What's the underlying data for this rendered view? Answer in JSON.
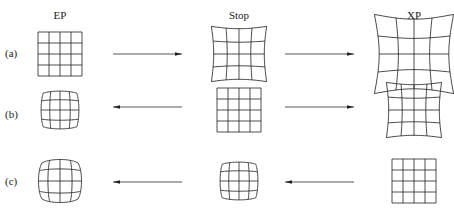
{
  "columns": [
    {
      "id": "ep",
      "label": "EP"
    },
    {
      "id": "stop",
      "label": "Stop"
    },
    {
      "id": "xp",
      "label": "XP"
    }
  ],
  "rows": [
    {
      "label": "(a)",
      "cells": {
        "ep": "square",
        "stop": "pincushion-slight",
        "xp": "pincushion-strong"
      },
      "arrows": [
        {
          "from": "ep",
          "to": "stop",
          "direction": "right"
        },
        {
          "from": "stop",
          "to": "xp",
          "direction": "right"
        }
      ]
    },
    {
      "label": "(b)",
      "cells": {
        "ep": "barrel-slight",
        "stop": "square",
        "xp": "pincushion-slight"
      },
      "arrows": [
        {
          "from": "stop",
          "to": "ep",
          "direction": "left"
        },
        {
          "from": "stop",
          "to": "xp",
          "direction": "right"
        }
      ]
    },
    {
      "label": "(c)",
      "cells": {
        "ep": "barrel-strong",
        "stop": "barrel-slight",
        "xp": "square"
      },
      "arrows": [
        {
          "from": "stop",
          "to": "ep",
          "direction": "left"
        },
        {
          "from": "xp",
          "to": "stop",
          "direction": "left"
        }
      ]
    }
  ],
  "colors": {
    "stroke": "#333333",
    "background": "#ffffff"
  }
}
